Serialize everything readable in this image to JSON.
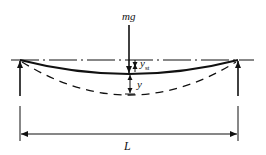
{
  "diagram": {
    "type": "simply-supported beam deflection",
    "labels": {
      "load": "mg",
      "static_deflection": "y",
      "static_deflection_sub": "st",
      "dynamic_deflection": "y",
      "span": "L"
    },
    "colors": {
      "line": "#111111",
      "background": "#ffffff"
    }
  }
}
